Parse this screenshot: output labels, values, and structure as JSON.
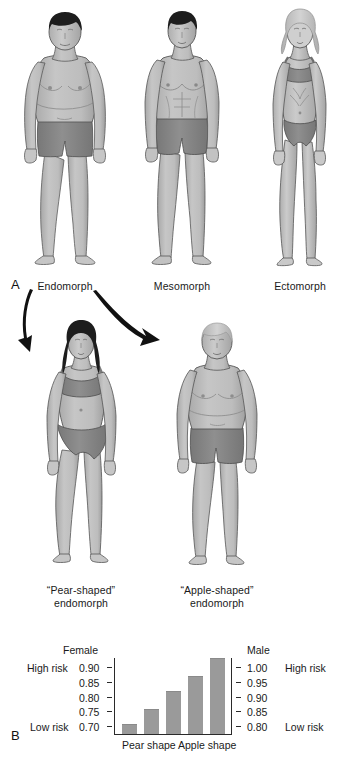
{
  "figure": {
    "panel_a_letter": "A",
    "panel_b_letter": "B"
  },
  "somatotypes": {
    "row1": [
      {
        "id": "endomorph",
        "label": "Endomorph"
      },
      {
        "id": "mesomorph",
        "label": "Mesomorph"
      },
      {
        "id": "ectomorph",
        "label": "Ectomorph"
      }
    ],
    "row2": [
      {
        "id": "pear-shaped-endomorph",
        "line1": "“Pear-shaped”",
        "line2": "endomorph"
      },
      {
        "id": "apple-shaped-endomorph",
        "line1": "“Apple-shaped”",
        "line2": "endomorph"
      }
    ]
  },
  "colors": {
    "skin": "#b9b9b9",
    "skin_light": "#c9c9c9",
    "garment": "#8a8a8a",
    "hair_dark": "#1d1d1d",
    "hair_light": "#c4c4c4",
    "outline": "#4a4a4a",
    "bar_fill": "#9a9a9a",
    "axis": "#2a2a2a",
    "text": "#1a1a1a",
    "arrow": "#111111"
  },
  "chart_data": {
    "type": "bar",
    "title": "",
    "categories": [
      "1",
      "2",
      "3",
      "4",
      "5"
    ],
    "values": [
      0.71,
      0.765,
      0.83,
      0.885,
      0.95
    ],
    "series": [
      {
        "name": "Waist-to-hip ratio",
        "values": [
          0.71,
          0.765,
          0.83,
          0.885,
          0.95
        ]
      }
    ],
    "left_axis": {
      "title": "Female",
      "ticks": [
        "0.90",
        "0.85",
        "0.80",
        "0.75",
        "0.70"
      ],
      "tick_values": [
        0.9,
        0.85,
        0.8,
        0.75,
        0.7
      ],
      "ylim": [
        0.675,
        0.955
      ]
    },
    "right_axis": {
      "title": "Male",
      "ticks": [
        "1.00",
        "0.95",
        "0.90",
        "0.85",
        "0.80"
      ],
      "tick_values": [
        1.0,
        0.95,
        0.9,
        0.85,
        0.8
      ],
      "ylim": [
        0.775,
        1.055
      ]
    },
    "risk_labels": {
      "high_left": "High risk",
      "low_left": "Low risk",
      "high_right": "High risk",
      "low_right": "Low risk"
    },
    "xlabel": "",
    "ylabel": "",
    "x_category_labels": [
      "Pear shape",
      "Apple shape"
    ],
    "grid": false,
    "legend": "none"
  }
}
